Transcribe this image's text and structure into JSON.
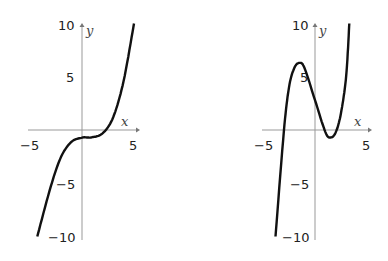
{
  "chart_data": [
    {
      "type": "line",
      "title": "",
      "xlabel": "x",
      "ylabel": "y",
      "xlim": [
        -5,
        5
      ],
      "ylim": [
        -10,
        10
      ],
      "x_ticks": [
        "-5",
        "5"
      ],
      "y_ticks": [
        "10",
        "5",
        "-5",
        "-10"
      ],
      "grid": false,
      "series": [
        {
          "name": "cubic-1",
          "x": [
            -4.3,
            -3,
            -2,
            -1,
            0,
            0.5,
            1,
            2,
            3,
            4,
            5
          ],
          "y": [
            -10,
            -5.3,
            -2.5,
            -1.1,
            -0.72,
            -0.7,
            -0.68,
            -0.3,
            1.2,
            4.6,
            10
          ]
        }
      ]
    },
    {
      "type": "line",
      "title": "",
      "xlabel": "x",
      "ylabel": "y",
      "xlim": [
        -5,
        5
      ],
      "ylim": [
        -10,
        10
      ],
      "x_ticks": [
        "-5",
        "5"
      ],
      "y_ticks": [
        "10",
        "5",
        "-5",
        "-10"
      ],
      "grid": false,
      "series": [
        {
          "name": "cubic-2",
          "x": [
            -3.8,
            -3,
            -2.5,
            -2,
            -1.5,
            -1,
            0,
            1,
            1.5,
            2,
            2.5,
            3,
            3.3
          ],
          "y": [
            -10,
            -0.2,
            4.0,
            5.8,
            6.3,
            5.8,
            2.8,
            -0.2,
            -0.7,
            -0.2,
            1.6,
            5.1,
            10
          ]
        }
      ]
    }
  ],
  "labels": {
    "x": "x",
    "y": "y",
    "t10": "10",
    "t5": "5",
    "tm5": "−5",
    "tm10": "−10",
    "xm5": "−5",
    "x5": "5"
  }
}
